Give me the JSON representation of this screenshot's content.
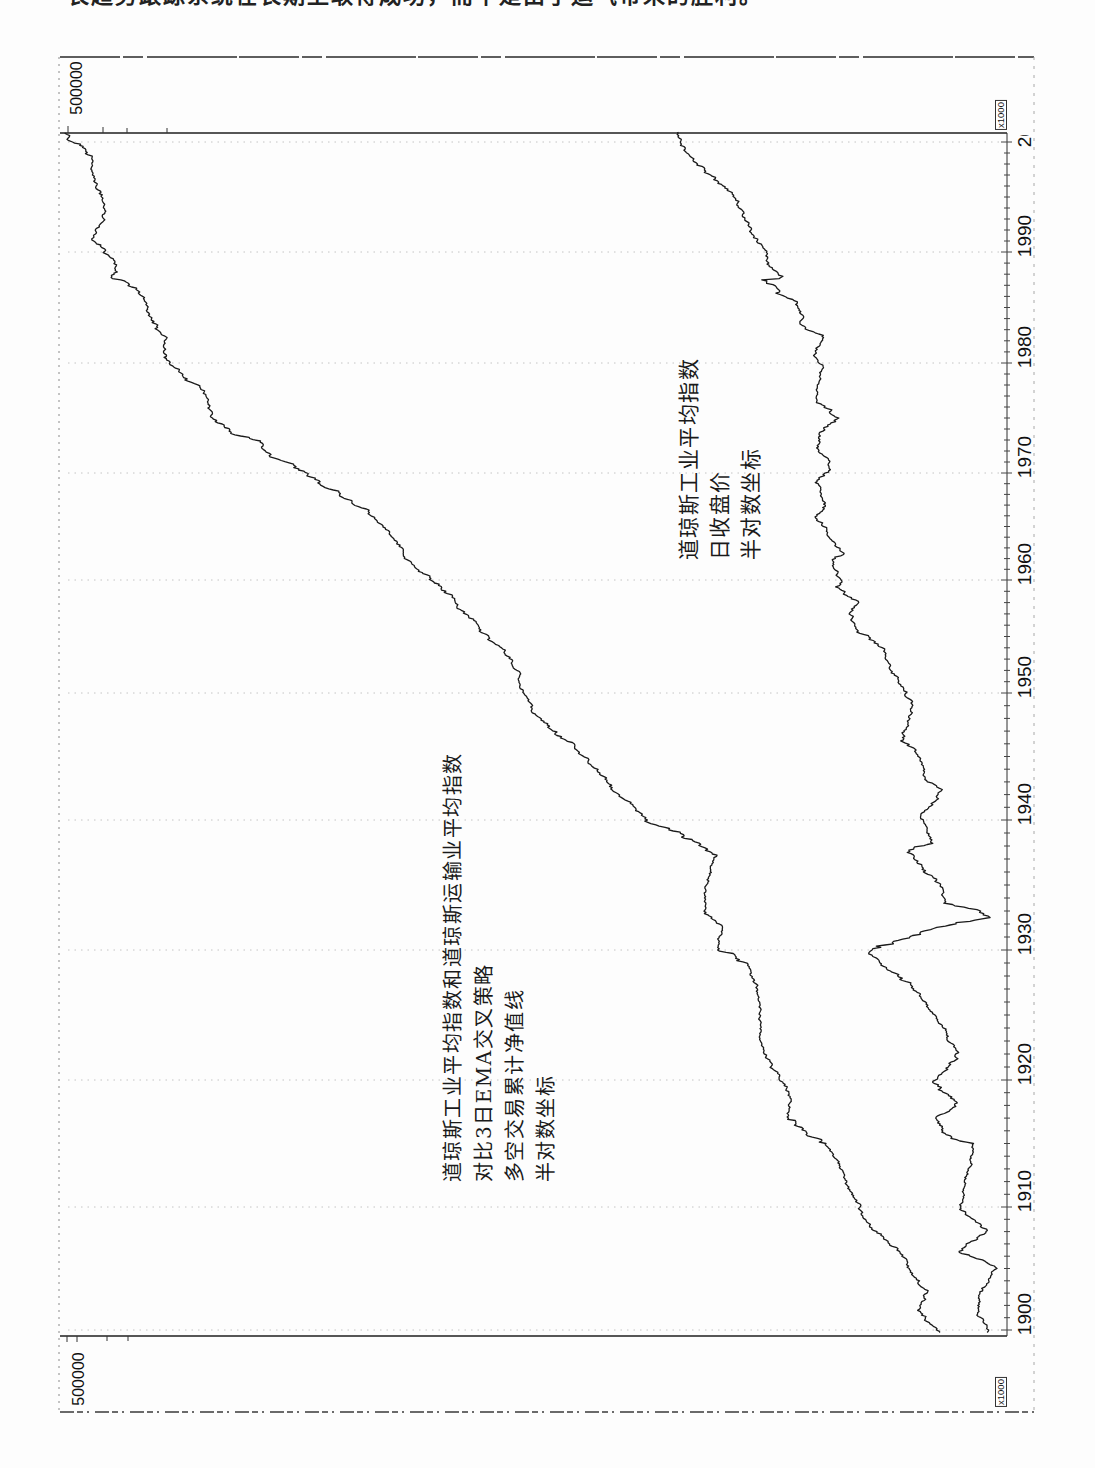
{
  "page": {
    "header_fragment": "长趋势跟踪系统在长期上取得成功，而不是由于运气带来的胜利。"
  },
  "chart_data": {
    "type": "line",
    "title": "",
    "orientation": "figure rotated 90° counter-clockwise on the scanned page (time axis runs bottom→top along right edge)",
    "xlabel": "",
    "ylabel": "",
    "grid": true,
    "legend": "none (series identified by in-plot text annotations)",
    "x": {
      "range": [
        1900,
        2001
      ],
      "ticks": [
        1900,
        1910,
        1920,
        1930,
        1940,
        1950,
        1960,
        1970,
        1980,
        1990,
        2000
      ],
      "tick_labels": [
        "1900",
        "1910",
        "1920",
        "1930",
        "1940",
        "1950",
        "1960",
        "1970",
        "1980",
        "1990",
        "2000"
      ]
    },
    "y": {
      "scale": "log (semi-log)",
      "top_strip_label": "500000",
      "bottom_strip_label": "500000",
      "multiplier_top": "x1000",
      "multiplier_bottom": "x1000",
      "ylim_primary_est": [
        100,
        500000
      ],
      "ylim_secondary_est": [
        40,
        12000
      ]
    },
    "annotations": [
      {
        "id": "strategy-equity-label",
        "lines": [
          "道琼斯工业平均指数和道琼斯运输业平均指数",
          "对比3日EMA交叉策略",
          "多空交易累计净值线",
          "半对数坐标"
        ]
      },
      {
        "id": "djia-label",
        "lines": [
          "道琼斯工业平均指数",
          "日收盘价",
          "半对数坐标"
        ]
      }
    ],
    "series": [
      {
        "name": "多空交易累计净值线 (DJIA vs DJTA 3日EMA交叉策略)",
        "axis": "primary",
        "color": "#1a1a1a",
        "points": [
          [
            1899.8,
            138
          ],
          [
            1901.6,
            171
          ],
          [
            1903.0,
            156
          ],
          [
            1904.9,
            183
          ],
          [
            1906.3,
            201
          ],
          [
            1908.1,
            259
          ],
          [
            1910.8,
            313
          ],
          [
            1912.9,
            344
          ],
          [
            1915.0,
            399
          ],
          [
            1915.8,
            482
          ],
          [
            1916.9,
            581
          ],
          [
            1918.7,
            565
          ],
          [
            1920.5,
            638
          ],
          [
            1922.1,
            728
          ],
          [
            1924.6,
            750
          ],
          [
            1927.2,
            771
          ],
          [
            1929.0,
            847
          ],
          [
            1930.0,
            1122
          ],
          [
            1931.8,
            1071
          ],
          [
            1932.8,
            1279
          ],
          [
            1935.4,
            1233
          ],
          [
            1937.2,
            1122
          ],
          [
            1938.5,
            1406
          ],
          [
            1940.0,
            2103
          ],
          [
            1941.3,
            2541
          ],
          [
            1943.7,
            3372
          ],
          [
            1946.1,
            4344
          ],
          [
            1947.3,
            5545
          ],
          [
            1948.9,
            6501
          ],
          [
            1950.5,
            7143
          ],
          [
            1951.8,
            7143
          ],
          [
            1954.1,
            8626
          ],
          [
            1955.8,
            10400
          ],
          [
            1957.6,
            12910
          ],
          [
            1958.8,
            14190
          ],
          [
            1960.7,
            17780
          ],
          [
            1961.9,
            20650
          ],
          [
            1964.4,
            24260
          ],
          [
            1966.3,
            29260
          ],
          [
            1969.3,
            46810
          ],
          [
            1970.7,
            60350
          ],
          [
            1971.9,
            77000
          ],
          [
            1972.8,
            82250
          ],
          [
            1973.7,
            106100
          ],
          [
            1975.0,
            127900
          ],
          [
            1976.8,
            135500
          ],
          [
            1977.7,
            144600
          ],
          [
            1979.2,
            177800
          ],
          [
            1980.5,
            204600
          ],
          [
            1982.3,
            197200
          ],
          [
            1983.2,
            214700
          ],
          [
            1984.3,
            235700
          ],
          [
            1985.9,
            242700
          ],
          [
            1986.4,
            254100
          ],
          [
            1987.3,
            292500
          ],
          [
            1987.7,
            330500
          ],
          [
            1988.2,
            312500
          ],
          [
            1989.5,
            337000
          ],
          [
            1990.4,
            363200
          ],
          [
            1991.1,
            399000
          ],
          [
            1992.5,
            370000
          ],
          [
            1993.6,
            353100
          ],
          [
            1995.2,
            359800
          ],
          [
            1996.1,
            380800
          ],
          [
            1997.0,
            399000
          ],
          [
            1998.5,
            399000
          ],
          [
            1999.5,
            438400
          ],
          [
            2000.0,
            477000
          ],
          [
            2000.8,
            514300
          ]
        ]
      },
      {
        "name": "道琼斯工业平均指数日收盘价",
        "axis": "secondary",
        "color": "#1a1a1a",
        "points": [
          [
            1899.8,
            46
          ],
          [
            1901.4,
            55
          ],
          [
            1903.0,
            52
          ],
          [
            1905.1,
            40
          ],
          [
            1906.3,
            75
          ],
          [
            1908.1,
            46
          ],
          [
            1909.8,
            75
          ],
          [
            1912.7,
            66
          ],
          [
            1915.0,
            59
          ],
          [
            1915.8,
            94
          ],
          [
            1916.9,
            112
          ],
          [
            1918.2,
            79
          ],
          [
            1919.8,
            120
          ],
          [
            1922.1,
            75
          ],
          [
            1924.1,
            101
          ],
          [
            1925.2,
            120
          ],
          [
            1927.2,
            171
          ],
          [
            1929.2,
            307
          ],
          [
            1929.8,
            367
          ],
          [
            1930.2,
            291
          ],
          [
            1931.3,
            151
          ],
          [
            1932.1,
            84
          ],
          [
            1932.5,
            45
          ],
          [
            1933.1,
            55
          ],
          [
            1933.6,
            101
          ],
          [
            1934.8,
            101
          ],
          [
            1937.5,
            190
          ],
          [
            1938.2,
            120
          ],
          [
            1939.2,
            134
          ],
          [
            1940.2,
            151
          ],
          [
            1941.3,
            127
          ],
          [
            1942.4,
            102
          ],
          [
            1943.1,
            134
          ],
          [
            1943.9,
            143
          ],
          [
            1945.5,
            160
          ],
          [
            1946.5,
            208
          ],
          [
            1947.6,
            187
          ],
          [
            1949.4,
            174
          ],
          [
            1950.3,
            204
          ],
          [
            1952.0,
            257
          ],
          [
            1953.8,
            282
          ],
          [
            1955.6,
            462
          ],
          [
            1957.1,
            523
          ],
          [
            1958.0,
            453
          ],
          [
            1959.4,
            682
          ],
          [
            1960.0,
            624
          ],
          [
            1961.9,
            719
          ],
          [
            1962.5,
            571
          ],
          [
            1964.0,
            745
          ],
          [
            1965.9,
            971
          ],
          [
            1967.2,
            814
          ],
          [
            1969.1,
            971
          ],
          [
            1970.3,
            745
          ],
          [
            1971.4,
            786
          ],
          [
            1972.5,
            938
          ],
          [
            1973.7,
            890
          ],
          [
            1975.0,
            624
          ],
          [
            1976.5,
            938
          ],
          [
            1978.0,
            938
          ],
          [
            1979.8,
            844
          ],
          [
            1981.0,
            971
          ],
          [
            1982.5,
            844
          ],
          [
            1983.4,
            1201
          ],
          [
            1984.3,
            1201
          ],
          [
            1985.5,
            1337
          ],
          [
            1986.4,
            1805
          ],
          [
            1987.5,
            2574
          ],
          [
            1987.7,
            1805
          ],
          [
            1988.8,
            2156
          ],
          [
            1990.6,
            2486
          ],
          [
            1991.3,
            2915
          ],
          [
            1993.1,
            3357
          ],
          [
            1994.5,
            3795
          ],
          [
            1995.5,
            4379
          ],
          [
            1997.0,
            6243
          ],
          [
            1997.9,
            7854
          ],
          [
            1998.8,
            8898
          ],
          [
            1999.7,
            10610
          ],
          [
            2000.9,
            11000
          ]
        ]
      }
    ]
  }
}
